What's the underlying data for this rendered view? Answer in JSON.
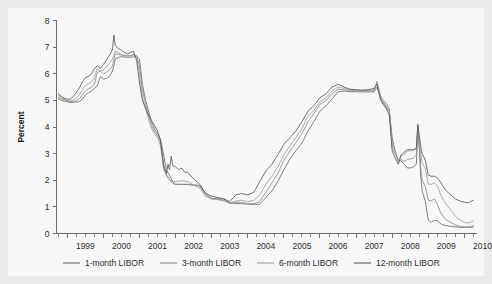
{
  "figure": {
    "background_color": "#e9e9e9",
    "panel_color": "#f7f7f7"
  },
  "chart_data": {
    "type": "line",
    "title": "",
    "xlabel": "",
    "ylabel": "Percent",
    "xlim": [
      1998.7,
      2010.35
    ],
    "ylim": [
      0,
      8
    ],
    "yticks": [
      0,
      1,
      2,
      3,
      4,
      5,
      6,
      7,
      8
    ],
    "ytick_labels": [
      "0",
      "1",
      "2",
      "3",
      "4",
      "5",
      "6",
      "7",
      "8"
    ],
    "xticks": [
      1999,
      2000,
      2001,
      2002,
      2003,
      2004,
      2005,
      2006,
      2007,
      2008,
      2009,
      2010
    ],
    "xtick_labels": [
      "1999",
      "2000",
      "2001",
      "2002",
      "2003",
      "2004",
      "2005",
      "2006",
      "2007",
      "2008",
      "2009",
      "2010"
    ],
    "x_minor_ticks_per_year": 4,
    "grid": false,
    "legend_position": "bottom",
    "series": [
      {
        "name": "1-month LIBOR",
        "color": "#6b6b6b",
        "x": [
          1998.75,
          1998.83,
          1998.92,
          1999.0,
          1999.08,
          1999.17,
          1999.25,
          1999.33,
          1999.42,
          1999.5,
          1999.58,
          1999.67,
          1999.75,
          1999.83,
          1999.92,
          2000.0,
          2000.08,
          2000.17,
          2000.25,
          2000.33,
          2000.42,
          2000.5,
          2000.58,
          2000.67,
          2000.75,
          2000.83,
          2000.92,
          2001.0,
          2001.08,
          2001.17,
          2001.25,
          2001.33,
          2001.42,
          2001.5,
          2001.58,
          2001.67,
          2001.75,
          2001.83,
          2001.92,
          2002.0,
          2002.17,
          2002.33,
          2002.5,
          2002.67,
          2002.83,
          2003.0,
          2003.17,
          2003.33,
          2003.5,
          2003.67,
          2003.83,
          2004.0,
          2004.17,
          2004.33,
          2004.5,
          2004.67,
          2004.83,
          2005.0,
          2005.17,
          2005.33,
          2005.5,
          2005.67,
          2005.83,
          2006.0,
          2006.17,
          2006.33,
          2006.5,
          2006.67,
          2006.83,
          2007.0,
          2007.17,
          2007.33,
          2007.5,
          2007.58,
          2007.67,
          2007.75,
          2007.83,
          2007.92,
          2008.0,
          2008.08,
          2008.17,
          2008.25,
          2008.33,
          2008.42,
          2008.5,
          2008.58,
          2008.67,
          2008.71,
          2008.75,
          2008.79,
          2008.83,
          2008.92,
          2009.0,
          2009.08,
          2009.17,
          2009.25,
          2009.33,
          2009.42,
          2009.5,
          2009.58,
          2009.67,
          2009.75,
          2009.83,
          2009.92,
          2010.0,
          2010.08,
          2010.17,
          2010.25
        ],
        "values": [
          5.06,
          5.0,
          4.97,
          4.95,
          4.92,
          4.93,
          4.94,
          4.95,
          5.05,
          5.2,
          5.28,
          5.35,
          5.45,
          5.55,
          5.9,
          5.8,
          5.82,
          5.9,
          6.1,
          6.55,
          6.62,
          6.64,
          6.63,
          6.62,
          6.62,
          6.63,
          6.65,
          6.55,
          5.6,
          5.0,
          4.6,
          4.2,
          3.9,
          3.75,
          3.55,
          2.95,
          2.35,
          2.2,
          1.95,
          1.85,
          1.84,
          1.84,
          1.82,
          1.81,
          1.5,
          1.32,
          1.3,
          1.3,
          1.15,
          1.12,
          1.12,
          1.1,
          1.09,
          1.1,
          1.35,
          1.6,
          1.95,
          2.4,
          2.8,
          3.1,
          3.4,
          3.85,
          4.2,
          4.6,
          4.8,
          5.05,
          5.32,
          5.35,
          5.33,
          5.32,
          5.32,
          5.32,
          5.32,
          5.5,
          5.12,
          4.9,
          4.75,
          4.6,
          3.6,
          3.1,
          2.75,
          2.72,
          2.6,
          2.46,
          2.46,
          2.5,
          2.6,
          4.05,
          3.2,
          2.2,
          1.6,
          1.2,
          0.5,
          0.42,
          0.5,
          0.48,
          0.38,
          0.32,
          0.3,
          0.28,
          0.26,
          0.25,
          0.24,
          0.23,
          0.23,
          0.23,
          0.23,
          0.24
        ]
      },
      {
        "name": "3-month LIBOR",
        "color": "#8c8c8c",
        "x": [
          1998.75,
          1998.83,
          1998.92,
          1999.0,
          1999.08,
          1999.17,
          1999.25,
          1999.33,
          1999.42,
          1999.5,
          1999.58,
          1999.67,
          1999.75,
          1999.83,
          1999.92,
          2000.0,
          2000.08,
          2000.17,
          2000.25,
          2000.33,
          2000.42,
          2000.5,
          2000.58,
          2000.67,
          2000.75,
          2000.83,
          2000.92,
          2001.0,
          2001.08,
          2001.17,
          2001.25,
          2001.33,
          2001.42,
          2001.5,
          2001.58,
          2001.67,
          2001.75,
          2001.83,
          2001.92,
          2002.0,
          2002.17,
          2002.33,
          2002.5,
          2002.67,
          2002.83,
          2003.0,
          2003.17,
          2003.33,
          2003.5,
          2003.67,
          2003.83,
          2004.0,
          2004.17,
          2004.33,
          2004.5,
          2004.67,
          2004.83,
          2005.0,
          2005.17,
          2005.33,
          2005.5,
          2005.67,
          2005.83,
          2006.0,
          2006.17,
          2006.33,
          2006.5,
          2006.67,
          2006.83,
          2007.0,
          2007.17,
          2007.33,
          2007.5,
          2007.58,
          2007.67,
          2007.75,
          2007.83,
          2007.92,
          2008.0,
          2008.08,
          2008.17,
          2008.25,
          2008.33,
          2008.42,
          2008.5,
          2008.58,
          2008.67,
          2008.71,
          2008.75,
          2008.79,
          2008.83,
          2008.92,
          2009.0,
          2009.08,
          2009.17,
          2009.25,
          2009.33,
          2009.42,
          2009.5,
          2009.58,
          2009.67,
          2009.75,
          2009.83,
          2009.92,
          2010.0,
          2010.08,
          2010.17,
          2010.25
        ],
        "values": [
          5.12,
          5.06,
          5.02,
          4.98,
          4.95,
          4.96,
          5.0,
          5.05,
          5.2,
          5.35,
          5.42,
          5.5,
          5.6,
          6.05,
          6.1,
          6.0,
          6.05,
          6.15,
          6.3,
          6.75,
          6.72,
          6.7,
          6.68,
          6.67,
          6.67,
          6.7,
          6.68,
          6.3,
          5.4,
          4.85,
          4.45,
          4.05,
          3.8,
          3.65,
          3.45,
          2.6,
          2.2,
          2.05,
          1.88,
          1.84,
          1.85,
          1.85,
          1.82,
          1.78,
          1.42,
          1.3,
          1.28,
          1.25,
          1.12,
          1.17,
          1.17,
          1.12,
          1.12,
          1.2,
          1.55,
          1.9,
          2.25,
          2.75,
          3.1,
          3.4,
          3.75,
          4.2,
          4.5,
          4.85,
          5.0,
          5.25,
          5.42,
          5.4,
          5.37,
          5.36,
          5.35,
          5.36,
          5.36,
          5.72,
          5.2,
          5.0,
          4.9,
          4.7,
          3.35,
          3.1,
          2.7,
          2.78,
          2.7,
          2.78,
          2.8,
          2.82,
          2.95,
          4.0,
          3.3,
          2.5,
          2.0,
          1.75,
          1.25,
          1.22,
          1.3,
          1.1,
          0.82,
          0.62,
          0.52,
          0.45,
          0.38,
          0.32,
          0.28,
          0.26,
          0.25,
          0.25,
          0.26,
          0.3
        ]
      },
      {
        "name": "6-month LIBOR",
        "color": "#9e9e9e",
        "x": [
          1998.75,
          1998.83,
          1998.92,
          1999.0,
          1999.08,
          1999.17,
          1999.25,
          1999.33,
          1999.42,
          1999.5,
          1999.58,
          1999.67,
          1999.75,
          1999.83,
          1999.92,
          2000.0,
          2000.08,
          2000.17,
          2000.25,
          2000.33,
          2000.42,
          2000.5,
          2000.58,
          2000.67,
          2000.75,
          2000.83,
          2000.92,
          2001.0,
          2001.08,
          2001.17,
          2001.25,
          2001.33,
          2001.42,
          2001.5,
          2001.58,
          2001.67,
          2001.75,
          2001.83,
          2001.92,
          2002.0,
          2002.17,
          2002.33,
          2002.5,
          2002.67,
          2002.83,
          2003.0,
          2003.17,
          2003.33,
          2003.5,
          2003.67,
          2003.83,
          2004.0,
          2004.17,
          2004.33,
          2004.5,
          2004.67,
          2004.83,
          2005.0,
          2005.17,
          2005.33,
          2005.5,
          2005.67,
          2005.83,
          2006.0,
          2006.17,
          2006.33,
          2006.5,
          2006.67,
          2006.83,
          2007.0,
          2007.17,
          2007.33,
          2007.5,
          2007.58,
          2007.67,
          2007.75,
          2007.83,
          2007.92,
          2008.0,
          2008.08,
          2008.17,
          2008.25,
          2008.33,
          2008.42,
          2008.5,
          2008.58,
          2008.67,
          2008.71,
          2008.75,
          2008.79,
          2008.83,
          2008.92,
          2009.0,
          2009.08,
          2009.17,
          2009.25,
          2009.33,
          2009.42,
          2009.5,
          2009.58,
          2009.67,
          2009.75,
          2009.83,
          2009.92,
          2010.0,
          2010.08,
          2010.17,
          2010.25
        ],
        "values": [
          5.2,
          5.1,
          5.05,
          5.0,
          4.98,
          5.02,
          5.1,
          5.2,
          5.4,
          5.55,
          5.62,
          5.7,
          5.85,
          6.2,
          6.1,
          6.15,
          6.25,
          6.4,
          6.55,
          6.85,
          6.78,
          6.72,
          6.7,
          6.68,
          6.68,
          6.72,
          6.65,
          6.0,
          5.15,
          4.65,
          4.3,
          3.95,
          3.75,
          3.6,
          3.3,
          2.42,
          2.15,
          2.0,
          1.95,
          1.95,
          1.98,
          1.95,
          1.82,
          1.7,
          1.4,
          1.3,
          1.27,
          1.22,
          1.15,
          1.22,
          1.25,
          1.2,
          1.25,
          1.45,
          1.85,
          2.15,
          2.5,
          2.95,
          3.3,
          3.6,
          3.95,
          4.4,
          4.62,
          4.95,
          5.1,
          5.35,
          5.5,
          5.45,
          5.4,
          5.38,
          5.38,
          5.38,
          5.4,
          5.65,
          5.1,
          4.95,
          4.82,
          4.6,
          3.2,
          3.0,
          2.75,
          2.95,
          2.95,
          3.1,
          3.1,
          3.12,
          3.2,
          4.05,
          3.5,
          3.0,
          2.65,
          2.45,
          1.85,
          1.85,
          1.9,
          1.8,
          1.5,
          1.25,
          1.1,
          0.95,
          0.8,
          0.65,
          0.55,
          0.48,
          0.42,
          0.4,
          0.42,
          0.48
        ]
      },
      {
        "name": "12-month LIBOR",
        "color": "#5a5a5a",
        "x": [
          1998.75,
          1998.83,
          1998.92,
          1999.0,
          1999.08,
          1999.17,
          1999.25,
          1999.33,
          1999.42,
          1999.5,
          1999.58,
          1999.67,
          1999.75,
          1999.83,
          1999.92,
          2000.0,
          2000.08,
          2000.17,
          2000.25,
          2000.29,
          2000.33,
          2000.42,
          2000.5,
          2000.58,
          2000.67,
          2000.75,
          2000.83,
          2000.92,
          2001.0,
          2001.08,
          2001.17,
          2001.25,
          2001.33,
          2001.42,
          2001.5,
          2001.58,
          2001.67,
          2001.75,
          2001.79,
          2001.83,
          2001.88,
          2001.92,
          2002.0,
          2002.08,
          2002.17,
          2002.25,
          2002.33,
          2002.5,
          2002.67,
          2002.83,
          2003.0,
          2003.17,
          2003.33,
          2003.5,
          2003.67,
          2003.83,
          2004.0,
          2004.17,
          2004.33,
          2004.5,
          2004.67,
          2004.83,
          2005.0,
          2005.17,
          2005.33,
          2005.5,
          2005.67,
          2005.83,
          2006.0,
          2006.17,
          2006.33,
          2006.5,
          2006.67,
          2006.83,
          2007.0,
          2007.17,
          2007.33,
          2007.5,
          2007.58,
          2007.67,
          2007.75,
          2007.83,
          2007.92,
          2008.0,
          2008.08,
          2008.17,
          2008.25,
          2008.33,
          2008.42,
          2008.5,
          2008.58,
          2008.67,
          2008.71,
          2008.75,
          2008.79,
          2008.83,
          2008.92,
          2009.0,
          2009.08,
          2009.17,
          2009.25,
          2009.33,
          2009.42,
          2009.5,
          2009.58,
          2009.67,
          2009.75,
          2009.83,
          2009.92,
          2010.0,
          2010.08,
          2010.17,
          2010.25
        ],
        "values": [
          5.25,
          5.15,
          5.08,
          5.05,
          5.05,
          5.15,
          5.3,
          5.45,
          5.7,
          5.85,
          5.9,
          6.0,
          6.2,
          6.3,
          6.2,
          6.35,
          6.5,
          6.7,
          6.9,
          7.45,
          7.05,
          6.95,
          6.88,
          6.8,
          6.75,
          6.8,
          6.85,
          6.5,
          5.65,
          5.0,
          4.7,
          4.45,
          4.25,
          4.05,
          3.85,
          3.5,
          2.5,
          2.25,
          2.6,
          2.4,
          2.9,
          2.55,
          2.5,
          2.4,
          2.45,
          2.3,
          2.3,
          2.05,
          1.85,
          1.5,
          1.4,
          1.35,
          1.3,
          1.2,
          1.45,
          1.5,
          1.45,
          1.55,
          1.95,
          2.35,
          2.6,
          2.95,
          3.35,
          3.6,
          3.85,
          4.2,
          4.6,
          4.8,
          5.1,
          5.25,
          5.5,
          5.6,
          5.5,
          5.42,
          5.4,
          5.38,
          5.4,
          5.45,
          5.6,
          5.05,
          4.85,
          4.7,
          4.45,
          3.1,
          2.85,
          2.6,
          2.95,
          3.05,
          3.15,
          3.15,
          3.15,
          3.2,
          4.1,
          3.7,
          3.3,
          3.0,
          2.75,
          2.2,
          2.15,
          2.15,
          2.1,
          1.95,
          1.75,
          1.6,
          1.5,
          1.4,
          1.3,
          1.25,
          1.2,
          1.18,
          1.15,
          1.2,
          1.25
        ]
      }
    ]
  },
  "legend": {
    "items": [
      {
        "label": "1-month LIBOR",
        "color": "#6b6b6b"
      },
      {
        "label": "3-month LIBOR",
        "color": "#8c8c8c"
      },
      {
        "label": "6-month LIBOR",
        "color": "#9e9e9e"
      },
      {
        "label": "12-month LIBOR",
        "color": "#5a5a5a"
      }
    ]
  }
}
